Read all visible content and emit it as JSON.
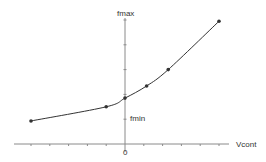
{
  "chart_data": {
    "type": "line",
    "title": "",
    "xlabel": "Vcont",
    "ylabel": "",
    "x_origin_label": "0",
    "y_annotations": [
      {
        "text": "fmax",
        "position": "top of y-axis"
      },
      {
        "text": "fmin",
        "position": "near first y tick, right of axis"
      }
    ],
    "x_ticks": [
      -5,
      -4,
      -3,
      -2,
      -1,
      0,
      1,
      2,
      3,
      4,
      5
    ],
    "y_ticks": [
      1,
      2,
      3,
      4,
      5
    ],
    "xlim": [
      -6.2,
      6.9
    ],
    "ylim": [
      0,
      5.5
    ],
    "grid": false,
    "legend": null,
    "series": [
      {
        "name": "f(Vcont)",
        "marker": "circle",
        "smooth": true,
        "x": [
          -5,
          -1,
          0,
          1.15,
          2.3,
          5
        ],
        "y": [
          0.93,
          1.5,
          1.85,
          2.34,
          3.0,
          4.95
        ]
      }
    ]
  },
  "labels": {
    "fmax": "fmax",
    "fmin": "fmin",
    "vcont": "Vcont",
    "zero": "0"
  },
  "colors": {
    "axis": "#8a8a8a",
    "line": "#333333",
    "marker": "#333333",
    "text": "#333333"
  }
}
